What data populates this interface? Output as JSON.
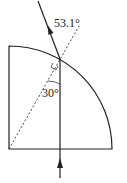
{
  "diagram": {
    "type": "optics-refraction",
    "labels": {
      "refraction_angle": "53.1°",
      "incidence_angle": "30°"
    },
    "colors": {
      "stroke": "#222222",
      "background": "#ffffff"
    }
  }
}
